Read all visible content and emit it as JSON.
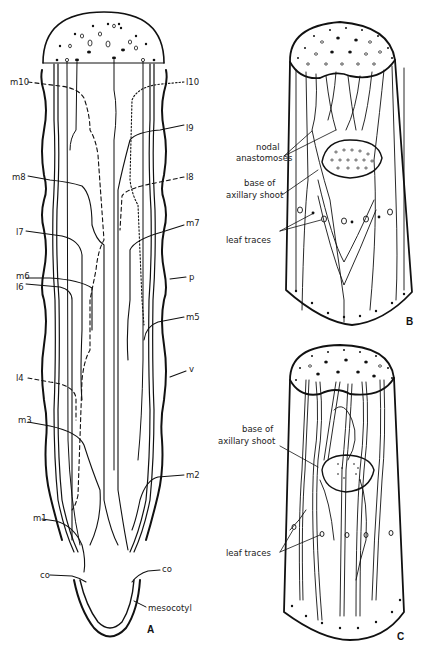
{
  "figure": {
    "panels": [
      {
        "id": "A",
        "label": "A",
        "labels_left": [
          "m10",
          "m8",
          "l7",
          "m6",
          "l6",
          "l4",
          "m3",
          "m1",
          "co"
        ],
        "labels_right": [
          "l10",
          "l9",
          "l8",
          "m7",
          "p",
          "m5",
          "v",
          "m2",
          "co",
          "mesocotyl"
        ]
      },
      {
        "id": "B",
        "label": "B",
        "callouts": [
          "nodal anastomoses",
          "base of axillary shoot",
          "leaf traces"
        ],
        "callout_lines": {
          "nodal": [
            "nodal",
            "anastomoses"
          ],
          "base": [
            "base of",
            "axillary shoot"
          ],
          "leaf": "leaf traces"
        }
      },
      {
        "id": "C",
        "label": "C",
        "callouts": [
          "base of axillary shoot",
          "leaf traces"
        ],
        "callout_lines": {
          "base": [
            "base of",
            "axillary shoot"
          ],
          "leaf": "leaf traces"
        }
      }
    ],
    "colors": {
      "ink": "#111111",
      "background": "#ffffff"
    }
  },
  "A": {
    "m10": "m10",
    "m8": "m8",
    "l7": "l7",
    "m6": "m6",
    "l6": "l6",
    "l4": "l4",
    "m3": "m3",
    "m1": "m1",
    "co_left": "co",
    "l10": "l10",
    "l9": "l9",
    "l8": "l8",
    "m7": "m7",
    "p": "p",
    "m5": "m5",
    "v": "v",
    "m2": "m2",
    "co_right": "co",
    "mesocotyl": "mesocotyl",
    "panel": "A"
  },
  "B": {
    "nodal1": "nodal",
    "nodal2": "anastomoses",
    "base1": "base of",
    "base2": "axillary shoot",
    "leaf": "leaf traces",
    "panel": "B"
  },
  "C": {
    "base1": "base of",
    "base2": "axillary shoot",
    "leaf": "leaf traces",
    "panel": "C"
  }
}
